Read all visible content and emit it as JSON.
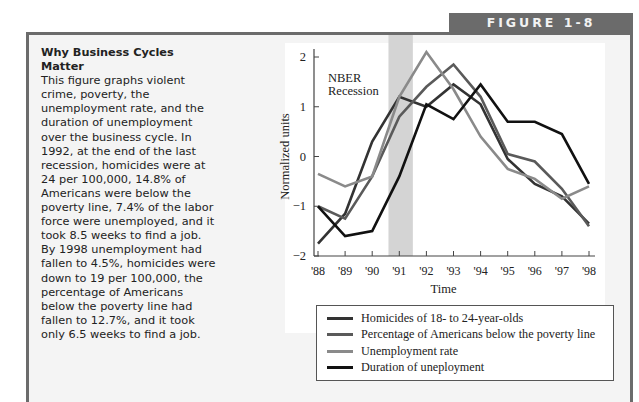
{
  "figure_label": "FIGURE 1-8",
  "caption": {
    "title": "Why Business Cycles Matter",
    "body": "This figure graphs violent crime, poverty, the unemployment rate, and the duration of unemployment over the business cycle. In 1992, at the end of the last recession, homicides were at 24 per 100,000, 14.8% of Americans were below the poverty line, 7.4% of the labor force were unemployed, and it took 8.5 weeks to find a job. By 1998 unemployment had fallen to 4.5%, homicides were down to 19 per 100,000, the percentage of Americans below the poverty line had fallen to 12.7%, and it took only 6.5 weeks to find a job."
  },
  "chart_data": {
    "type": "line",
    "title": "",
    "xlabel": "Time",
    "ylabel": "Normalized units",
    "x": [
      "'88",
      "'89",
      "'90",
      "'91",
      "'92",
      "'93",
      "'94",
      "'95",
      "'96",
      "'97",
      "'98"
    ],
    "ylim": [
      -2,
      2
    ],
    "yticks": [
      -2,
      -1,
      0,
      1,
      2
    ],
    "ytick_labels": [
      "−2",
      "−1",
      "0",
      "1",
      "2"
    ],
    "grid": false,
    "annotation": {
      "text_line1": "NBER",
      "text_line2": "Recession",
      "shaded_range": [
        2.6,
        3.5
      ],
      "shade_color": "#d4d4d4"
    },
    "legend_position": "bottom",
    "series": [
      {
        "name": "Homicides of 18- to 24-year-olds",
        "color": "#333333",
        "values": [
          -1.75,
          -1.15,
          0.3,
          1.2,
          1.0,
          1.45,
          1.05,
          -0.05,
          -0.55,
          -0.8,
          -1.35
        ]
      },
      {
        "name": "Percentage of Americans below the poverty line",
        "color": "#5a5a5a",
        "values": [
          -1.0,
          -1.25,
          -0.4,
          0.8,
          1.4,
          1.85,
          1.2,
          0.05,
          -0.1,
          -0.65,
          -1.4
        ]
      },
      {
        "name": "Unemployment rate",
        "color": "#8a8a8a",
        "values": [
          -0.35,
          -0.6,
          -0.4,
          1.2,
          2.1,
          1.35,
          0.4,
          -0.25,
          -0.45,
          -0.85,
          -0.6
        ]
      },
      {
        "name": "Duration of uneployment",
        "color": "#111111",
        "values": [
          -1.0,
          -1.6,
          -1.5,
          -0.4,
          1.05,
          0.75,
          1.45,
          0.7,
          0.7,
          0.45,
          -0.55
        ]
      }
    ]
  }
}
